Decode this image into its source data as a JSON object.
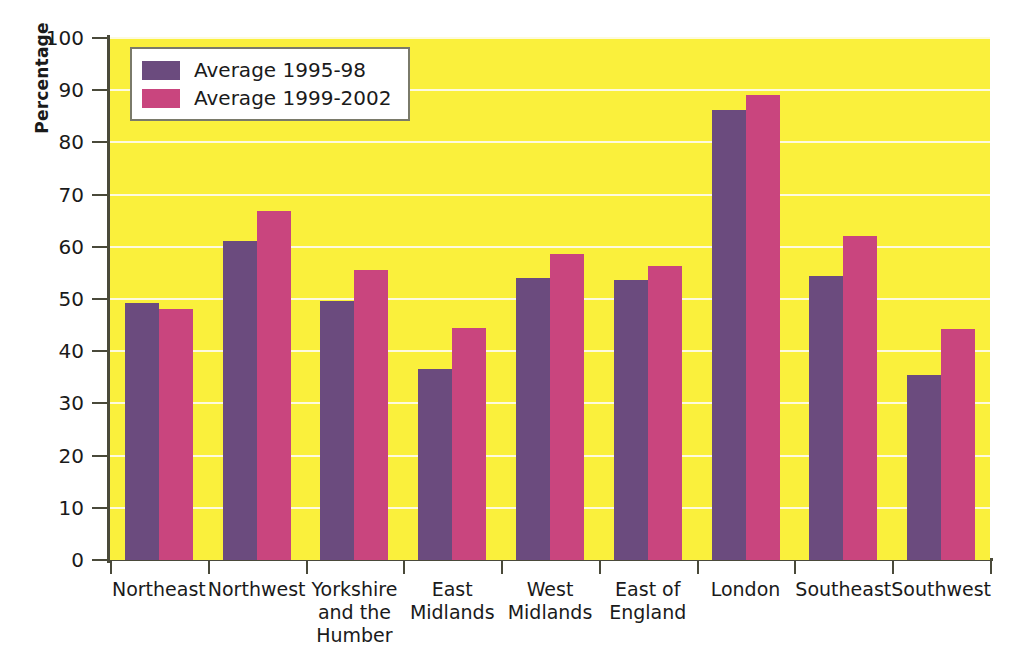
{
  "chart_data": {
    "type": "bar",
    "title": "",
    "xlabel": "",
    "ylabel": "Percentage",
    "ylim": [
      0,
      100
    ],
    "ytick_step": 10,
    "yticks": [
      0,
      10,
      20,
      30,
      40,
      50,
      60,
      70,
      80,
      90,
      100
    ],
    "grid": true,
    "legend_position": "upper-left-inside",
    "categories": [
      "Northeast",
      "Northwest",
      "Yorkshire and the Humber",
      "East Midlands",
      "West Midlands",
      "East of England",
      "London",
      "Southeast",
      "Southwest"
    ],
    "category_lines": [
      [
        "Northeast"
      ],
      [
        "Northwest"
      ],
      [
        "Yorkshire",
        "and the",
        "Humber"
      ],
      [
        "East",
        "Midlands"
      ],
      [
        "West",
        "Midlands"
      ],
      [
        "East of",
        "England"
      ],
      [
        "London"
      ],
      [
        "Southeast"
      ],
      [
        "Southwest"
      ]
    ],
    "series": [
      {
        "name": "Average 1995-98",
        "color": "#6b4b7e",
        "values": [
          49.2,
          61.1,
          49.7,
          36.6,
          54.0,
          53.6,
          86.2,
          54.4,
          35.4
        ]
      },
      {
        "name": "Average 1999-2002",
        "color": "#c9457e",
        "values": [
          48.0,
          66.9,
          55.6,
          44.4,
          58.6,
          56.4,
          89.0,
          62.0,
          44.2
        ]
      }
    ],
    "plot_background": "#faf03c",
    "gridline_color": "#fdfadf",
    "axis_color": "#4a4a3a"
  },
  "legend": {
    "entries": [
      {
        "label": "Average 1995-98",
        "swatch": "#6b4b7e"
      },
      {
        "label": "Average 1999-2002",
        "swatch": "#c9457e"
      }
    ]
  }
}
